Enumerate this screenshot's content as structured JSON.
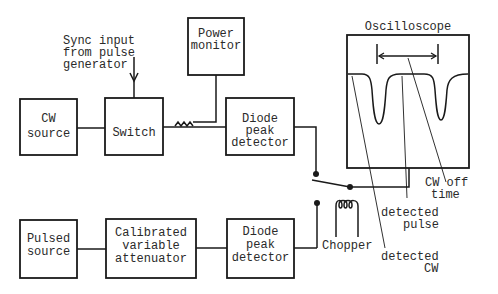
{
  "blocks": {
    "cw_source": [
      "CW",
      "source"
    ],
    "switch": [
      "Switch"
    ],
    "power_monitor": [
      "Power",
      "monitor"
    ],
    "diode_top": [
      "Diode",
      "peak",
      "detector"
    ],
    "pulsed_source": [
      "Pulsed",
      "source"
    ],
    "attenuator": [
      "Calibrated",
      "variable",
      "attenuator"
    ],
    "diode_bottom": [
      "Diode",
      "peak",
      "detector"
    ],
    "oscilloscope": "Oscilloscope"
  },
  "annotations": {
    "sync_input": [
      "Sync input",
      "from pulse",
      "generator"
    ],
    "chopper": "Chopper",
    "cw_off_time": [
      "CW off",
      "time"
    ],
    "detected_pulse": [
      "detected",
      "pulse"
    ],
    "detected_cw": [
      "detected",
      "CW"
    ]
  },
  "colors": {
    "ink": "#1a1a1a",
    "background": "#ffffff"
  }
}
